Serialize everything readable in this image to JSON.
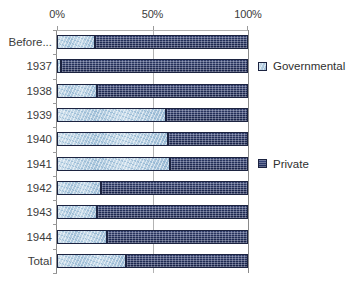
{
  "chart_data": {
    "type": "bar",
    "orientation": "horizontal",
    "stacked": true,
    "normalized_percent": true,
    "title": "",
    "subtitle": "",
    "xlabel": "",
    "ylabel": "",
    "xlim": [
      0,
      100
    ],
    "grid": true,
    "legend_position": "right",
    "categories": [
      "Before...",
      "1937",
      "1938",
      "1939",
      "1940",
      "1941",
      "1942",
      "1943",
      "1944",
      "Total"
    ],
    "x_tick_labels": [
      "0%",
      "50%",
      "100%"
    ],
    "x_ticks": [
      0,
      50,
      100
    ],
    "series": [
      {
        "name": "Governmental",
        "color": "#b9d0e2",
        "values": [
          20,
          2,
          21,
          57,
          58,
          59,
          23,
          21,
          26,
          36
        ]
      },
      {
        "name": "Private",
        "color": "#2c3a6d",
        "values": [
          80,
          98,
          79,
          43,
          42,
          41,
          77,
          79,
          74,
          64
        ]
      }
    ]
  },
  "legend": {
    "entries": [
      {
        "label": "Governmental",
        "swatch_name": "legend-swatch-governmental"
      },
      {
        "label": "Private",
        "swatch_name": "legend-swatch-private"
      }
    ]
  },
  "colors": {
    "governmental": "#b9d0e2",
    "private": "#2c3a6d",
    "gridline": "#b3b3b3",
    "axis": "#8a8a8a",
    "text": "#3c3c3c",
    "background": "#ffffff"
  }
}
